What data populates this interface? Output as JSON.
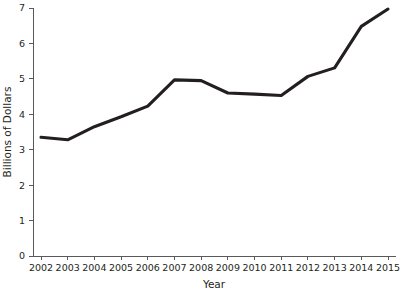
{
  "chart_data": {
    "type": "line",
    "title": "",
    "xlabel": "Year",
    "ylabel": "Billions of Dollars",
    "categories": [
      "2002",
      "2003",
      "2004",
      "2005",
      "2006",
      "2007",
      "2008",
      "2009",
      "2010",
      "2011",
      "2012",
      "2013",
      "2014",
      "2015"
    ],
    "x": [
      2002,
      2003,
      2004,
      2005,
      2006,
      2007,
      2008,
      2009,
      2010,
      2011,
      2012,
      2013,
      2014,
      2015
    ],
    "values": [
      3.35,
      3.28,
      3.65,
      3.93,
      4.23,
      4.97,
      4.95,
      4.6,
      4.57,
      4.53,
      5.07,
      5.31,
      6.48,
      6.97
    ],
    "series": [
      {
        "name": "Billions of Dollars",
        "values": [
          3.35,
          3.28,
          3.65,
          3.93,
          4.23,
          4.97,
          4.95,
          4.6,
          4.57,
          4.53,
          5.07,
          5.31,
          6.48,
          6.97
        ]
      }
    ],
    "ylim": [
      0,
      7
    ],
    "xlim": [
      2002,
      2015
    ],
    "yticks": [
      0,
      1,
      2,
      3,
      4,
      5,
      6,
      7
    ],
    "ytick_labels": [
      "0",
      "1",
      "2",
      "3",
      "4",
      "5",
      "6",
      "7"
    ],
    "xtick_labels": [
      "2002",
      "2003",
      "2004",
      "2005",
      "2006",
      "2007",
      "2008",
      "2009",
      "2010",
      "2011",
      "2012",
      "2013",
      "2014",
      "2015"
    ],
    "grid": false,
    "legend": false,
    "legend_position": "none",
    "line_color": "#231f20",
    "axis_color": "#58595b",
    "background_color": "#ffffff"
  }
}
